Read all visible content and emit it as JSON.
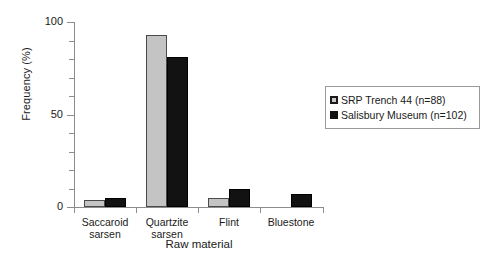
{
  "chart_data": {
    "type": "bar",
    "title": "",
    "xlabel": "Raw material",
    "ylabel": "Frequency (%)",
    "categories": [
      "Saccaroid sarsen",
      "Quartzite sarsen",
      "Flint",
      "Bluestone"
    ],
    "category_lines": [
      [
        "Saccaroid",
        "sarsen"
      ],
      [
        "Quartzite",
        "sarsen"
      ],
      [
        "Flint",
        ""
      ],
      [
        "Bluestone",
        ""
      ]
    ],
    "series": [
      {
        "name": "SRP Trench 44 (n=88)",
        "color": "#c4c4c4",
        "values": [
          4,
          93,
          5,
          0
        ]
      },
      {
        "name": "Salisbury Museum (n=102)",
        "color": "#121212",
        "values": [
          5,
          81,
          10,
          7
        ]
      }
    ],
    "ylim": [
      0,
      100
    ],
    "ytick_labels": [
      "0",
      "50",
      "100"
    ],
    "ytick_values": [
      0,
      50,
      100
    ],
    "yminor_step": 10,
    "grid": false,
    "legend_position": "right"
  }
}
